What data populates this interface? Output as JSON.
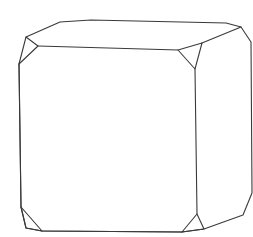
{
  "diagram": {
    "stroke_color": "#3a3a3a",
    "background": "#ffffff",
    "outline": "M21,64 L26,37 L60,22 L91,20 L226,23 L241,27 L251,42 L252,193 L243,215 L204,229 L182,232 L42,231 L26,228 L21,207 Z",
    "front_face": "M38,46 L178,50 L195,69 L197,214 L182,232 M42,231 L21,207 L19,64 L38,46",
    "top_back_edge": "M202,43 L241,27",
    "front_top_right_link": "M178,50 L202,43",
    "corner_facets": [
      {
        "name": "top-left-facet",
        "d": "M26,37 L38,46 L19,64 Z"
      },
      {
        "name": "top-right-facet",
        "d": "M178,50 L202,43 L195,69 Z"
      },
      {
        "name": "bottom-right-facet",
        "d": "M197,214 L182,232 L204,229 Z"
      },
      {
        "name": "bottom-left-facet",
        "d": "M21,207 L26,228 L42,231 Z"
      }
    ],
    "right_face": "M202,43 L195,69 M197,214 L204,229"
  }
}
